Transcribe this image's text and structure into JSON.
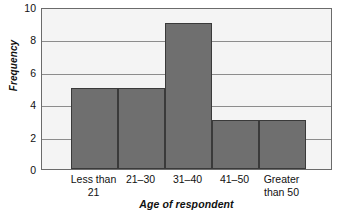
{
  "chart_data": {
    "type": "bar",
    "title": "",
    "subtitle": "",
    "xlabel": "Age of respondent",
    "ylabel": "Frequency",
    "categories": [
      "Less than 21",
      "21–30",
      "31–40",
      "41–50",
      "Greater than 50"
    ],
    "category_lines": [
      [
        "Less than",
        "21"
      ],
      [
        "21–30",
        ""
      ],
      [
        "31–40",
        ""
      ],
      [
        "41–50",
        ""
      ],
      [
        "Greater",
        "than 50"
      ]
    ],
    "values": [
      5,
      5,
      9,
      3,
      3
    ],
    "xlim": [
      0,
      5
    ],
    "ylim": [
      0,
      10
    ],
    "yticks": [
      0,
      2,
      4,
      6,
      8,
      10
    ],
    "ytick_labels": [
      "0",
      "2",
      "4",
      "6",
      "8",
      "10"
    ],
    "gridlines": "horizontal",
    "grid": true,
    "legend": "none",
    "legend_position": "none",
    "bar_gap": "none",
    "annotations": []
  },
  "style": {
    "bar_fill": "#6f6f6f",
    "bar_stroke": "#3a3a3a",
    "plot_background": "#f4f4f4",
    "gridline_color": "#8c8c8c",
    "axis_color": "#6b6b6b",
    "text_color": "#111111",
    "page_background": "#ffffff"
  }
}
